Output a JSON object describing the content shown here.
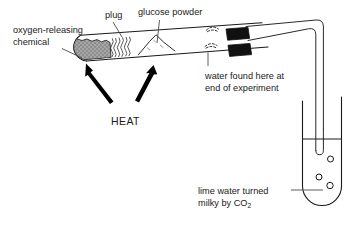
{
  "figure": {
    "background_color": "#ffffff",
    "ink_color": "#1a1a1a"
  },
  "labels": {
    "oxygen_releasing": {
      "line1": "oxygen-releasing",
      "line2": "chemical"
    },
    "plug": "plug",
    "glucose_powder": "glucose powder",
    "water_found": {
      "line1": "water found here at",
      "line2": "end of experiment"
    },
    "heat": "HEAT",
    "lime_water": {
      "line1": "lime water turned",
      "line2_prefix": "milky by CO",
      "line2_subscript": "2"
    }
  },
  "apparatus": {
    "test_tube": {
      "name": "inclined test tube",
      "contents": [
        "oxygen-releasing chemical",
        "plug",
        "glucose powder",
        "condensed water droplets"
      ]
    },
    "bung": {
      "name": "rubber bung",
      "color": "#111111"
    },
    "delivery_tube": {
      "name": "delivery tube",
      "path": "bends over the top-right and dips into the lime water"
    },
    "collection_tube": {
      "name": "test tube of lime water",
      "liquid": "lime water",
      "bubbles": 3
    },
    "heat_arrows": 2
  },
  "colors": {
    "chemical_fill": "#9a9a9a",
    "bung_fill": "#111111",
    "glass_stroke": "#1a1a1a",
    "leader_stroke": "#4a4a4a"
  }
}
